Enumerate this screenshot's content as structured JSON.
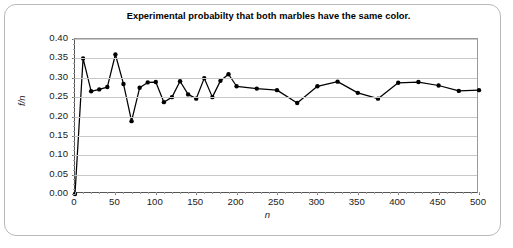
{
  "chart_data": {
    "type": "line",
    "title": "Experimental probabilty that both marbles have the same color.",
    "xlabel": "n",
    "ylabel": "f/n",
    "xlim": [
      0,
      500
    ],
    "ylim": [
      0.0,
      0.4
    ],
    "grid": true,
    "legend": "none",
    "marker": "filled-circle",
    "line_color": "#000000",
    "marker_color": "#000000",
    "grid_color": "#c8c8c8",
    "xticks": [
      0,
      50,
      100,
      150,
      200,
      250,
      300,
      350,
      400,
      450,
      500
    ],
    "xtick_labels": [
      "0",
      "50",
      "100",
      "150",
      "200",
      "250",
      "300",
      "350",
      "400",
      "450",
      "500"
    ],
    "yticks": [
      0.0,
      0.05,
      0.1,
      0.15,
      0.2,
      0.25,
      0.3,
      0.35,
      0.4
    ],
    "ytick_labels": [
      "0.00",
      "0.05",
      "0.10",
      "0.15",
      "0.20",
      "0.25",
      "0.30",
      "0.35",
      "0.40"
    ],
    "series": [
      {
        "name": "f/n",
        "x": [
          0,
          10,
          20,
          30,
          40,
          50,
          60,
          70,
          80,
          90,
          100,
          110,
          120,
          130,
          140,
          150,
          160,
          170,
          180,
          190,
          200,
          225,
          250,
          275,
          300,
          325,
          350,
          375,
          400,
          425,
          450,
          475,
          500
        ],
        "values": [
          0.0,
          0.35,
          0.265,
          0.27,
          0.276,
          0.36,
          0.284,
          0.188,
          0.274,
          0.288,
          0.289,
          0.237,
          0.25,
          0.291,
          0.257,
          0.246,
          0.299,
          0.25,
          0.292,
          0.309,
          0.278,
          0.272,
          0.268,
          0.235,
          0.278,
          0.29,
          0.261,
          0.246,
          0.287,
          0.289,
          0.28,
          0.266,
          0.268
        ]
      }
    ]
  }
}
